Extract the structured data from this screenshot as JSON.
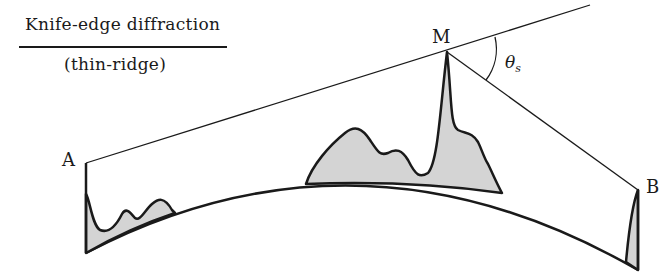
{
  "figure": {
    "title": "Knife-edge diffraction",
    "subtitle": "(thin-ridge)",
    "points": {
      "a": "A",
      "m": "M",
      "b": "B"
    },
    "angle_label": "θ",
    "angle_subscript": "s",
    "colors": {
      "stroke": "#1a1a1a",
      "terrain_fill": "#d4d4d4",
      "background": "#ffffff"
    }
  }
}
